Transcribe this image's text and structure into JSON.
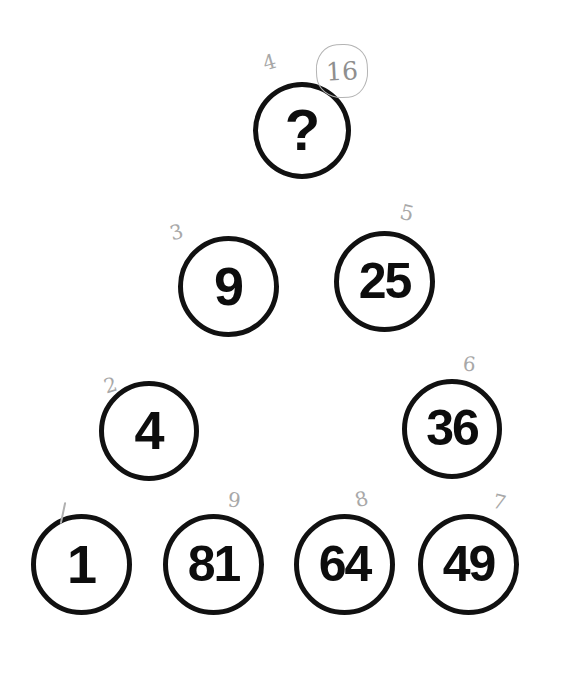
{
  "document": {
    "title": "Number Circles Puzzle Worksheet",
    "background_color": "#ffffff",
    "ink_color": "#111111",
    "pencil_color": "#9a9a9a"
  },
  "nodes": [
    {
      "id": "q",
      "value": "?",
      "row": 1,
      "annotation": "4",
      "is_answer_slot": true
    },
    {
      "id": "n9",
      "value": "9",
      "row": 2,
      "annotation": "3",
      "is_answer_slot": false
    },
    {
      "id": "n25",
      "value": "25",
      "row": 2,
      "annotation": "5",
      "is_answer_slot": false
    },
    {
      "id": "n4",
      "value": "4",
      "row": 3,
      "annotation": "2",
      "is_answer_slot": false
    },
    {
      "id": "n36",
      "value": "36",
      "row": 3,
      "annotation": "6",
      "is_answer_slot": false
    },
    {
      "id": "n1",
      "value": "1",
      "row": 4,
      "annotation": "1",
      "is_answer_slot": false
    },
    {
      "id": "n81",
      "value": "81",
      "row": 4,
      "annotation": "9",
      "is_answer_slot": false
    },
    {
      "id": "n64",
      "value": "64",
      "row": 4,
      "annotation": "8",
      "is_answer_slot": false
    },
    {
      "id": "n49",
      "value": "49",
      "row": 4,
      "annotation": "7",
      "is_answer_slot": false
    }
  ],
  "handwriting": {
    "root_4": "4",
    "root_3": "3",
    "root_5": "5",
    "root_2": "2",
    "root_6": "6",
    "root_9": "9",
    "root_8": "8",
    "root_7": "7",
    "boxed_answer": "16"
  }
}
